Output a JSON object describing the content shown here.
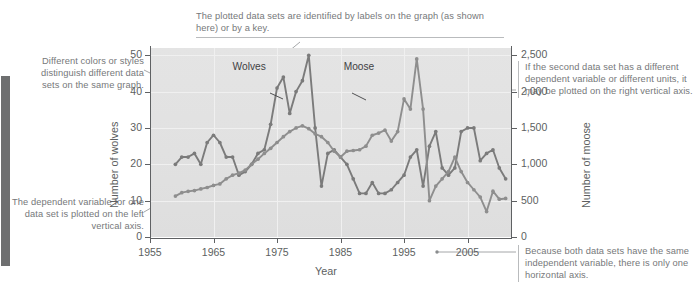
{
  "figure": {
    "kind": "annotated-textbook-figure",
    "background": "#ffffff",
    "panel_color": "#e2e2e2"
  },
  "annotations": [
    {
      "id": "labels-note",
      "name": "annotation-plot-labels",
      "text": "The plotted data sets are identified by labels on the graph (as shown here) or by a key."
    },
    {
      "id": "colors-note",
      "name": "annotation-colors-styles",
      "text": "Different colors or styles distinguish different data sets on the same graph."
    },
    {
      "id": "dependent-note",
      "name": "annotation-left-vertical-axis",
      "text": "The dependent variable for one data set is plotted on the left vertical axis."
    },
    {
      "id": "second-note",
      "name": "annotation-right-vertical-axis",
      "text": "If the second data set has a different dependent variable or different units, it may be plotted on the right vertical axis."
    },
    {
      "id": "independent-note",
      "name": "annotation-horizontal-axis",
      "text": "Because both data sets have the same independent variable, there is only one horizontal axis."
    }
  ],
  "chart_data": {
    "type": "line",
    "title": "",
    "xlabel": "Year",
    "ylabel": "Number of wolves",
    "y2label": "Number of moose",
    "grid": true,
    "legend_position": "inline-labels",
    "xlim": [
      1955,
      2012
    ],
    "xticks": [
      1955,
      1965,
      1975,
      1985,
      1995,
      2005
    ],
    "xticklabels": [
      "1955",
      "1965",
      "1975",
      "1985",
      "1995",
      "2005"
    ],
    "ylim": [
      0,
      52
    ],
    "yticks": [
      0,
      10,
      20,
      30,
      40,
      50
    ],
    "yticklabels": [
      "0",
      "10",
      "20",
      "30",
      "40",
      "50"
    ],
    "y2lim": [
      0,
      2600
    ],
    "y2ticks": [
      0,
      500,
      1000,
      1500,
      2000,
      2500
    ],
    "y2ticklabels": [
      "0",
      "500",
      "1,000",
      "1,500",
      "2,000",
      "2,500"
    ],
    "annotations_on_plot": [
      {
        "name": "series-label-wolves",
        "text": "Wolves",
        "x": 1968.0,
        "y": 46.5
      },
      {
        "name": "series-label-moose",
        "text": "Moose",
        "x": 1985.5,
        "y": 46.5
      }
    ],
    "series": [
      {
        "name": "Wolves",
        "axis": "left",
        "color": "#7b7b7b",
        "marker": "circle",
        "x": [
          1959,
          1960,
          1961,
          1962,
          1963,
          1964,
          1965,
          1966,
          1967,
          1968,
          1969,
          1970,
          1971,
          1972,
          1973,
          1974,
          1975,
          1976,
          1977,
          1978,
          1979,
          1980,
          1981,
          1982,
          1983,
          1984,
          1985,
          1986,
          1987,
          1988,
          1989,
          1990,
          1991,
          1992,
          1993,
          1994,
          1995,
          1996,
          1997,
          1998,
          1999,
          2000,
          2001,
          2002,
          2003,
          2004,
          2005,
          2006,
          2007,
          2008,
          2009,
          2010,
          2011
        ],
        "values": [
          20,
          22,
          22,
          23,
          20,
          26,
          28,
          26,
          22,
          22,
          17,
          18,
          20,
          23,
          24,
          31,
          41,
          44,
          34,
          40,
          43,
          50,
          30,
          14,
          23,
          24,
          22,
          20,
          16,
          12,
          12,
          15,
          12,
          12,
          13,
          15,
          17,
          22,
          24,
          14,
          25,
          29,
          19,
          17,
          19,
          29,
          30,
          30,
          21,
          23,
          24,
          19,
          16
        ]
      },
      {
        "name": "Moose",
        "axis": "right",
        "color": "#8e8e8e",
        "marker": "circle",
        "x": [
          1959,
          1960,
          1961,
          1962,
          1963,
          1964,
          1965,
          1966,
          1967,
          1968,
          1969,
          1970,
          1971,
          1972,
          1973,
          1974,
          1975,
          1976,
          1977,
          1978,
          1979,
          1980,
          1981,
          1982,
          1983,
          1984,
          1985,
          1986,
          1987,
          1988,
          1989,
          1990,
          1991,
          1992,
          1993,
          1994,
          1995,
          1996,
          1997,
          1998,
          1999,
          2000,
          2001,
          2002,
          2003,
          2004,
          2005,
          2006,
          2007,
          2008,
          2009,
          2010,
          2011
        ],
        "values": [
          563,
          610,
          628,
          639,
          662,
          681,
          710,
          730,
          800,
          850,
          880,
          920,
          1000,
          1070,
          1150,
          1220,
          1300,
          1380,
          1450,
          1500,
          1530,
          1490,
          1420,
          1380,
          1300,
          1180,
          1100,
          1180,
          1190,
          1200,
          1250,
          1400,
          1430,
          1470,
          1320,
          1450,
          1900,
          1760,
          2450,
          1760,
          500,
          700,
          800,
          900,
          1100,
          900,
          750,
          650,
          550,
          350,
          630,
          520,
          530
        ]
      }
    ]
  }
}
